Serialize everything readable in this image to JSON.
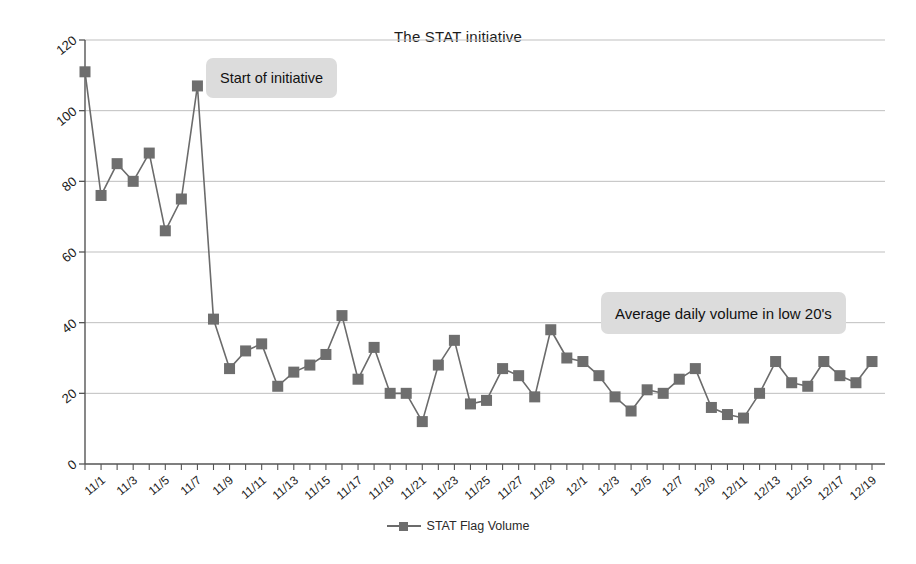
{
  "chart_data": {
    "type": "line",
    "title": "The STAT initiative",
    "xlabel": "",
    "ylabel": "",
    "ylim": [
      0,
      120
    ],
    "ytick_step": 20,
    "yticks": [
      0,
      20,
      40,
      60,
      80,
      100,
      120
    ],
    "grid": true,
    "legend_position": "bottom",
    "series": [
      {
        "name": "STAT Flag Volume",
        "marker": "square",
        "color": "#6e6e6e",
        "values": [
          111,
          76,
          85,
          80,
          88,
          66,
          75,
          107,
          41,
          27,
          32,
          34,
          22,
          26,
          28,
          31,
          42,
          24,
          33,
          20,
          20,
          12,
          28,
          35,
          17,
          18,
          27,
          25,
          19,
          38,
          30,
          29,
          25,
          19,
          15,
          21,
          20,
          24,
          27,
          16,
          14,
          13,
          20,
          29,
          23,
          22,
          29,
          25,
          23,
          29
        ]
      }
    ],
    "categories": [
      "11/1",
      "11/2",
      "11/3",
      "11/4",
      "11/5",
      "11/6",
      "11/7",
      "11/8",
      "11/9",
      "11/10",
      "11/11",
      "11/12",
      "11/13",
      "11/14",
      "11/15",
      "11/16",
      "11/17",
      "11/18",
      "11/19",
      "11/20",
      "11/21",
      "11/22",
      "11/23",
      "11/24",
      "11/25",
      "11/26",
      "11/27",
      "11/28",
      "11/29",
      "11/30",
      "12/1",
      "12/2",
      "12/3",
      "12/4",
      "12/5",
      "12/6",
      "12/7",
      "12/8",
      "12/9",
      "12/10",
      "12/11",
      "12/12",
      "12/13",
      "12/14",
      "12/15",
      "12/16",
      "12/17",
      "12/18",
      "12/19",
      "12/20"
    ],
    "xtick_labels": [
      "11/1",
      "11/3",
      "11/5",
      "11/7",
      "11/9",
      "11/11",
      "11/13",
      "11/15",
      "11/17",
      "11/19",
      "11/21",
      "11/23",
      "11/25",
      "11/27",
      "11/29",
      "12/1",
      "12/3",
      "12/5",
      "12/7",
      "12/9",
      "12/11",
      "12/13",
      "12/15",
      "12/17",
      "12/19"
    ],
    "annotations": [
      {
        "text": "Start of initiative",
        "anchor_category": "11/8"
      },
      {
        "text": "Average daily volume in low 20's",
        "anchor_category": "12/6"
      }
    ]
  },
  "legend": {
    "label": "STAT Flag Volume"
  },
  "colors": {
    "series": "#6e6e6e",
    "line": "#6b6b6b",
    "grid": "#bfbfbf",
    "axis": "#555555",
    "callout_bg": "#dcdcdc",
    "text": "#1c1c1c"
  }
}
